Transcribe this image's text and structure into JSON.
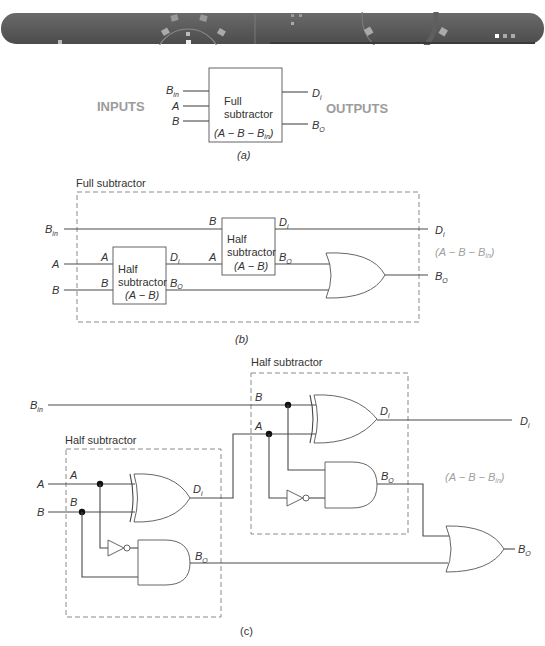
{
  "banner": {
    "description": "decorative dark gray header bar with circular gear motifs",
    "indicator_dots": 3
  },
  "figure_a": {
    "caption": "(a)",
    "inputs_label": "INPUTS",
    "outputs_label": "OUTPUTS",
    "block": {
      "line1": "Full",
      "line2": "subtractor",
      "equation": "(A − B − B",
      "equation_sub": "in",
      "equation_end": ")"
    },
    "inputs": [
      {
        "name": "B",
        "sub": "in"
      },
      {
        "name": "A",
        "sub": ""
      },
      {
        "name": "B",
        "sub": ""
      }
    ],
    "outputs": [
      {
        "name": "D",
        "sub": "i"
      },
      {
        "name": "B",
        "sub": "O"
      }
    ]
  },
  "figure_b": {
    "caption": "(b)",
    "group_label": "Full subtractor",
    "half1": {
      "line1": "Half",
      "line2": "subtractor",
      "line3": "(A − B)",
      "in_a": "A",
      "in_b": "B",
      "out_d": "D",
      "out_d_sub": "i",
      "out_b": "B",
      "out_b_sub": "O"
    },
    "half2": {
      "line1": "Half",
      "line2": "subtractor",
      "line3": "(A − B)",
      "in_a": "A",
      "in_b": "B",
      "out_d": "D",
      "out_d_sub": "i",
      "out_b": "B",
      "out_b_sub": "O"
    },
    "inputs": [
      {
        "name": "B",
        "sub": "in"
      },
      {
        "name": "A",
        "sub": ""
      },
      {
        "name": "B",
        "sub": ""
      }
    ],
    "outputs": [
      {
        "name": "D",
        "sub": "i"
      },
      {
        "name": "B",
        "sub": "O"
      }
    ],
    "equation": "(A − B − B",
    "equation_sub": "in",
    "equation_end": ")"
  },
  "figure_c": {
    "caption": "(c)",
    "half1_label": "Half subtractor",
    "half2_label": "Half subtractor",
    "inputs": [
      {
        "name": "B",
        "sub": "in"
      },
      {
        "name": "A",
        "sub": ""
      },
      {
        "name": "B",
        "sub": ""
      }
    ],
    "inner_labels": {
      "a": "A",
      "b": "B",
      "d": "D",
      "d_sub": "i",
      "bo": "B",
      "bo_sub": "O"
    },
    "outputs": [
      {
        "name": "D",
        "sub": "i"
      },
      {
        "name": "B",
        "sub": "O"
      }
    ],
    "equation": "(A − B − B",
    "equation_sub": "in",
    "equation_end": ")"
  }
}
